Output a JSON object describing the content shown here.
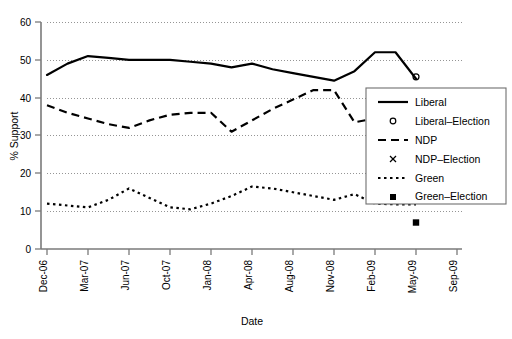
{
  "chart_data": {
    "type": "line",
    "title": "",
    "xlabel": "Date",
    "ylabel": "% Support",
    "ylim": [
      0,
      60
    ],
    "yticks": [
      0,
      10,
      20,
      30,
      40,
      50,
      60
    ],
    "grid": true,
    "grid_style": "dotted-horizontal",
    "legend_position": "right",
    "xtick_labels": [
      "Dec-06",
      "Mar-07",
      "Jun-07",
      "Oct-07",
      "Jan-08",
      "Apr-08",
      "Aug-08",
      "Nov-08",
      "Feb-09",
      "May-09",
      "Sep-09"
    ],
    "x": [
      "Dec-06",
      "Feb-07",
      "Mar-07",
      "May-07",
      "Jun-07",
      "Aug-07",
      "Oct-07",
      "Nov-07",
      "Jan-08",
      "Feb-08",
      "Apr-08",
      "Jun-08",
      "Aug-08",
      "Sep-08",
      "Nov-08",
      "Dec-08",
      "Feb-09",
      "Mar-09",
      "May-09"
    ],
    "series": [
      {
        "name": "Liberal",
        "style": "solid",
        "color": "#000000",
        "values": [
          46,
          49,
          51,
          50.5,
          50,
          50,
          50,
          49.5,
          49,
          48,
          49,
          47.5,
          46.5,
          45.5,
          44.5,
          47,
          52,
          52,
          45
        ]
      },
      {
        "name": "NDP",
        "style": "dashed",
        "color": "#000000",
        "values": [
          38,
          36,
          34.5,
          33,
          32,
          34,
          35.5,
          36,
          36,
          31,
          34,
          37,
          39.5,
          42,
          42,
          33.5,
          34.5,
          33.5,
          37
        ]
      },
      {
        "name": "Green",
        "style": "dotted",
        "color": "#000000",
        "values": [
          12,
          11.5,
          11,
          13,
          16,
          13.5,
          11,
          10.5,
          12,
          14,
          16.5,
          16,
          15,
          14,
          13,
          14.5,
          12,
          11.8,
          11.8
        ]
      }
    ],
    "election_markers": [
      {
        "name": "Liberal-Election",
        "marker": "circle",
        "x": "May-09",
        "value": 45.5
      },
      {
        "name": "NDP-Election",
        "marker": "x",
        "x": "May-09",
        "value": 41.5
      },
      {
        "name": "Green-Election",
        "marker": "square",
        "x": "May-09",
        "value": 7
      }
    ],
    "legend_entries": [
      {
        "label": "Liberal",
        "kind": "line",
        "style": "solid"
      },
      {
        "label": "Liberal–Election",
        "kind": "marker",
        "style": "circle"
      },
      {
        "label": "NDP",
        "kind": "line",
        "style": "dashed"
      },
      {
        "label": "NDP–Election",
        "kind": "marker",
        "style": "x"
      },
      {
        "label": "Green",
        "kind": "line",
        "style": "dotted"
      },
      {
        "label": "Green–Election",
        "kind": "marker",
        "style": "square"
      }
    ]
  },
  "axes": {
    "y_title": "% Support",
    "x_title": "Date",
    "y_tick_0": "0",
    "y_tick_10": "10",
    "y_tick_20": "20",
    "y_tick_30": "30",
    "y_tick_40": "40",
    "y_tick_50": "50",
    "y_tick_60": "60",
    "x_tick_0": "Dec-06",
    "x_tick_1": "Mar-07",
    "x_tick_2": "Jun-07",
    "x_tick_3": "Oct-07",
    "x_tick_4": "Jan-08",
    "x_tick_5": "Apr-08",
    "x_tick_6": "Aug-08",
    "x_tick_7": "Nov-08",
    "x_tick_8": "Feb-09",
    "x_tick_9": "May-09",
    "x_tick_10": "Sep-09"
  },
  "legend": {
    "item_0": "Liberal",
    "item_1": "Liberal–Election",
    "item_2": "NDP",
    "item_3": "NDP–Election",
    "item_4": "Green",
    "item_5": "Green–Election"
  },
  "colors": {
    "ink": "#000000",
    "axis": "#7a7a7a",
    "grid": "#8a8a8a"
  }
}
